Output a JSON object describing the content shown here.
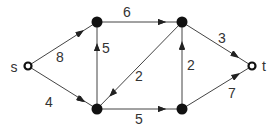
{
  "diagram": {
    "type": "directed-graph",
    "nodes": [
      {
        "id": "s",
        "label": "s",
        "x": 28,
        "y": 66,
        "style": "hollow"
      },
      {
        "id": "a",
        "label": "",
        "x": 97,
        "y": 22,
        "style": "filled"
      },
      {
        "id": "b",
        "label": "",
        "x": 97,
        "y": 109,
        "style": "filled"
      },
      {
        "id": "c",
        "label": "",
        "x": 182,
        "y": 22,
        "style": "filled"
      },
      {
        "id": "d",
        "label": "",
        "x": 182,
        "y": 109,
        "style": "filled"
      },
      {
        "id": "t",
        "label": "t",
        "x": 252,
        "y": 66,
        "style": "hollow"
      }
    ],
    "edges": [
      {
        "from": "s",
        "to": "a",
        "weight": "8"
      },
      {
        "from": "s",
        "to": "b",
        "weight": "4"
      },
      {
        "from": "b",
        "to": "a",
        "weight": "5"
      },
      {
        "from": "a",
        "to": "c",
        "weight": "6"
      },
      {
        "from": "c",
        "to": "b",
        "weight": "2"
      },
      {
        "from": "d",
        "to": "c",
        "weight": "2"
      },
      {
        "from": "b",
        "to": "d",
        "weight": "5"
      },
      {
        "from": "c",
        "to": "t",
        "weight": "3"
      },
      {
        "from": "d",
        "to": "t",
        "weight": "7"
      }
    ]
  },
  "labels": {
    "s": "s",
    "t": "t",
    "w_sa": "8",
    "w_sb": "4",
    "w_ba": "5",
    "w_ac": "6",
    "w_cb": "2",
    "w_dc": "2",
    "w_bd": "5",
    "w_ct": "3",
    "w_dt": "7"
  }
}
